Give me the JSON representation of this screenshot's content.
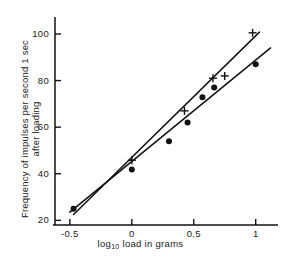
{
  "chart_data": {
    "type": "scatter",
    "title": "",
    "xlabel": "log10 load in grams",
    "xlabel_base": "log",
    "xlabel_sub": "10",
    "xlabel_rest": " load in grams",
    "ylabel_line1": "Frequency of impulses per second 1 sec",
    "ylabel_line2": "after loading",
    "xlim": [
      -0.62,
      1.18
    ],
    "ylim": [
      18,
      106
    ],
    "grid": false,
    "legend": "none",
    "xticks": [
      -0.5,
      0,
      0.5,
      1
    ],
    "xticklabels": [
      "-0.5",
      "0",
      "0.5",
      "1"
    ],
    "yticks": [
      20,
      40,
      60,
      80,
      100
    ],
    "yticklabels": [
      "20",
      "40",
      "60",
      "80",
      "100"
    ],
    "series": [
      {
        "name": "circles",
        "marker": "filled-circle",
        "points": [
          {
            "x": -0.47,
            "y": 25.0
          },
          {
            "x": 0.0,
            "y": 41.8
          },
          {
            "x": 0.3,
            "y": 54.0
          },
          {
            "x": 0.45,
            "y": 62.0
          },
          {
            "x": 0.57,
            "y": 72.8
          },
          {
            "x": 0.665,
            "y": 77.0
          },
          {
            "x": 1.0,
            "y": 87.0
          }
        ],
        "fit_line": {
          "x0": -0.5,
          "y0": 23.5,
          "x1": 1.12,
          "y1": 94.0
        }
      },
      {
        "name": "plus-marks",
        "marker": "plus",
        "points": [
          {
            "x": 0.0,
            "y": 45.8
          },
          {
            "x": 0.425,
            "y": 67.0
          },
          {
            "x": 0.655,
            "y": 81.0
          },
          {
            "x": 0.75,
            "y": 82.0
          },
          {
            "x": 0.975,
            "y": 100.5
          }
        ],
        "fit_line": {
          "x0": -0.47,
          "y0": 22.5,
          "x1": 1.03,
          "y1": 100.8
        }
      }
    ]
  }
}
